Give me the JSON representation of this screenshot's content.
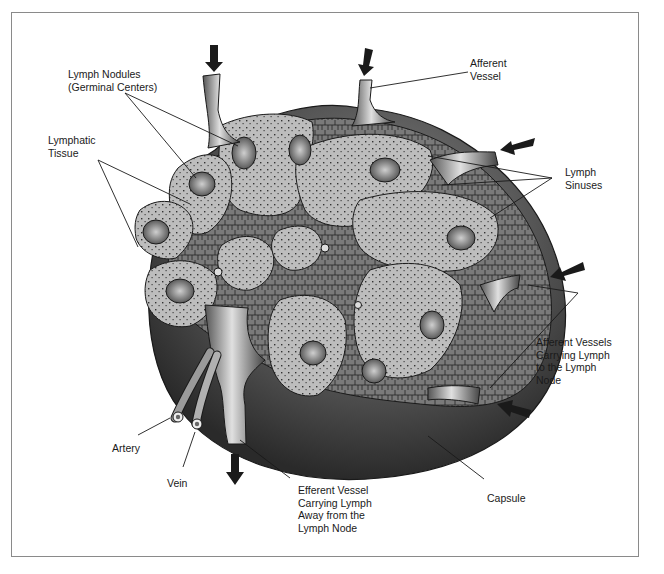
{
  "diagram": {
    "colors": {
      "capsule_dark": "#3a3a3a",
      "tissue": "#b8b8b8",
      "sinus": "#d9d9d9",
      "outline": "#1a1a1a",
      "border": "#8a8a8a"
    },
    "labels": {
      "lymph_nodules": [
        "Lymph Nodules",
        "(Germinal Centers)"
      ],
      "lymphatic_tissue": [
        "Lymphatic",
        "Tissue"
      ],
      "afferent_vessel": [
        "Afferent",
        "Vessel"
      ],
      "lymph_sinuses": [
        "Lymph",
        "Sinuses"
      ],
      "afferent_vessels": [
        "Afferent Vessels",
        "Carrying Lymph",
        "to the Lymph",
        "Node"
      ],
      "artery": [
        "Artery"
      ],
      "vein": [
        "Vein"
      ],
      "efferent_vessel": [
        "Efferent Vessel",
        "Carrying Lymph",
        "Away from the",
        "Lymph Node"
      ],
      "capsule": [
        "Capsule"
      ]
    },
    "arrows": [
      {
        "name": "afferent-arrow-top-left",
        "direction": "down"
      },
      {
        "name": "afferent-arrow-top",
        "direction": "down"
      },
      {
        "name": "afferent-arrow-right-upper",
        "direction": "left"
      },
      {
        "name": "afferent-arrow-right-middle",
        "direction": "left"
      },
      {
        "name": "afferent-arrow-right-lower",
        "direction": "left"
      },
      {
        "name": "efferent-arrow-bottom",
        "direction": "down"
      }
    ]
  }
}
